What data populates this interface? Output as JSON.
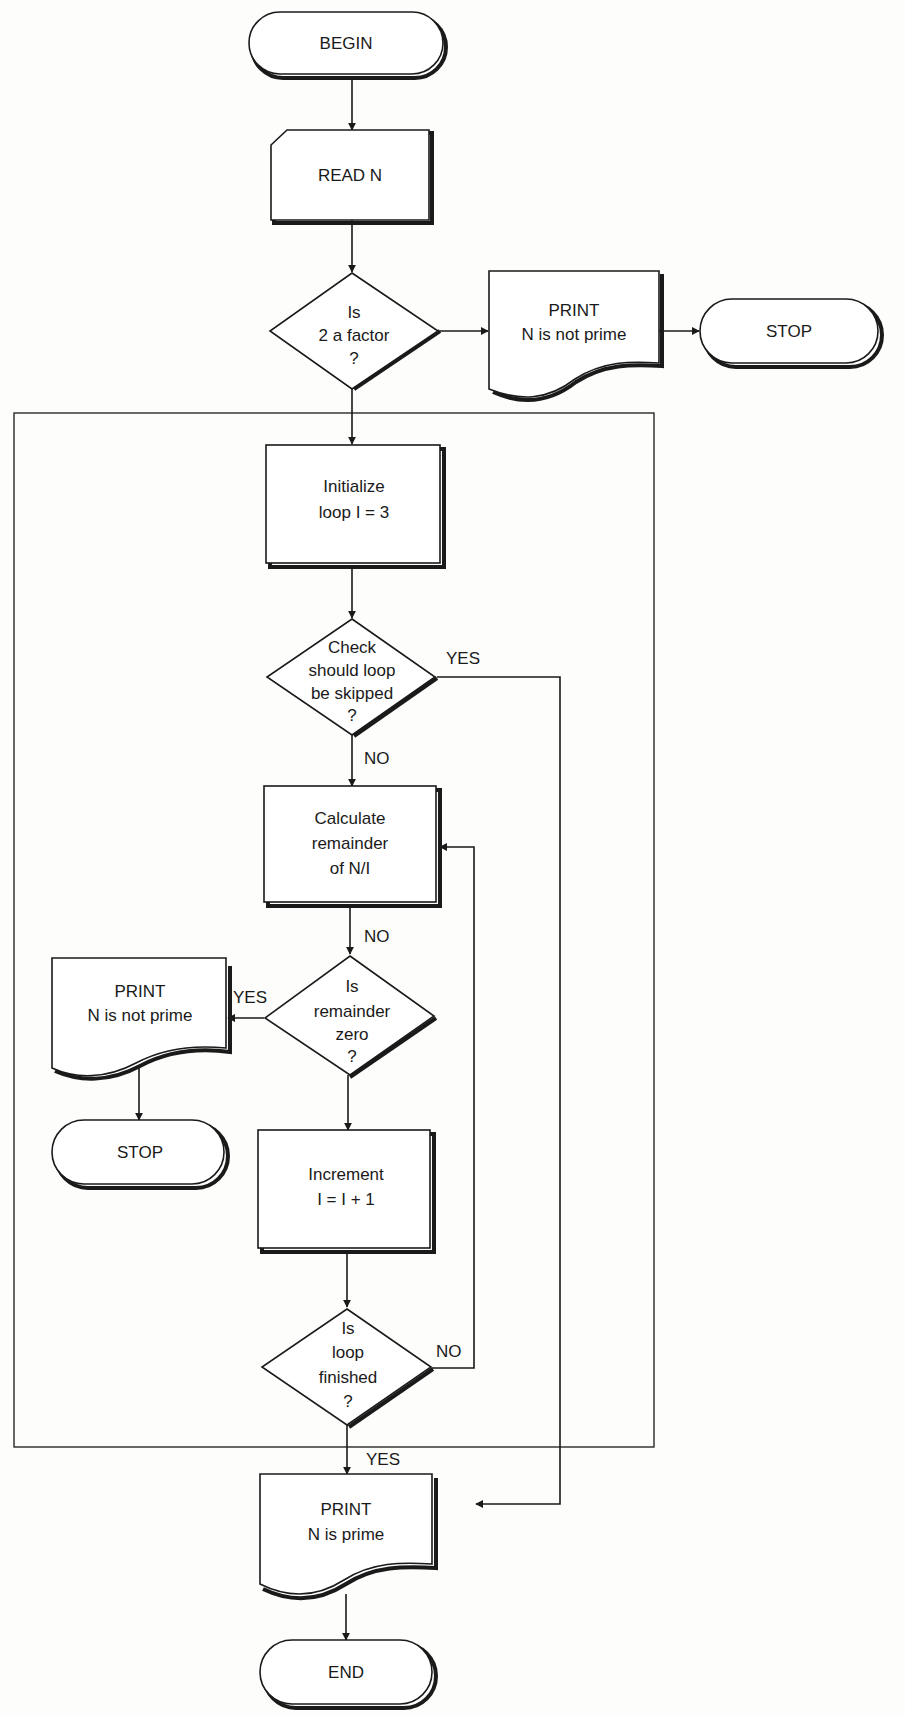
{
  "diagram": {
    "nodes": [
      {
        "id": "begin",
        "type": "terminal",
        "lines": [
          "BEGIN"
        ],
        "x": 248,
        "y": 12,
        "w": 196,
        "h": 64
      },
      {
        "id": "read",
        "type": "input",
        "lines": [
          "READ N"
        ],
        "x": 270,
        "y": 130,
        "w": 160,
        "h": 90
      },
      {
        "id": "two_factor",
        "type": "decision",
        "lines": [
          "Is",
          "2 a factor",
          "?"
        ],
        "cx": 356,
        "cy": 331,
        "hw": 84,
        "hh": 58
      },
      {
        "id": "print_not_prime_1",
        "type": "document",
        "lines": [
          "PRINT",
          "N is not prime"
        ],
        "x": 458,
        "y": 271,
        "w": 152,
        "h": 92
      },
      {
        "id": "stop_1",
        "type": "terminal",
        "lines": [
          "STOP"
        ],
        "x": 640,
        "y": 299,
        "w": 148,
        "h": 66
      },
      {
        "id": "init_loop",
        "type": "process",
        "lines": [
          "Initialize",
          "loop  I = 3"
        ],
        "x": 266,
        "y": 445,
        "w": 134,
        "h": 120
      },
      {
        "id": "skip_check",
        "type": "decision",
        "lines": [
          "Check",
          "should loop",
          "be skipped",
          "?"
        ],
        "cx": 352,
        "cy": 677,
        "hw": 85,
        "hh": 58
      },
      {
        "id": "calc_rem",
        "type": "process",
        "lines": [
          "Calculate",
          "remainder",
          "of N/I"
        ],
        "x": 264,
        "y": 786,
        "w": 174,
        "h": 118
      },
      {
        "id": "rem_zero",
        "type": "decision",
        "lines": [
          "Is",
          "remainder",
          "zero",
          "?"
        ],
        "cx": 348,
        "cy": 1015,
        "hw": 84,
        "hh": 60
      },
      {
        "id": "print_not_prime_2",
        "type": "document",
        "lines": [
          "PRINT",
          "N is not prime"
        ],
        "x": 52,
        "y": 958,
        "w": 174,
        "h": 92
      },
      {
        "id": "stop_2",
        "type": "terminal",
        "lines": [
          "STOP"
        ],
        "x": 52,
        "y": 1120,
        "w": 174,
        "h": 66
      },
      {
        "id": "increment",
        "type": "process",
        "lines": [
          "Increment",
          "I = I + 1"
        ],
        "x": 258,
        "y": 1130,
        "w": 174,
        "h": 120
      },
      {
        "id": "loop_done",
        "type": "decision",
        "lines": [
          "Is",
          "loop",
          "finished",
          "?"
        ],
        "cx": 347,
        "cy": 1365,
        "hw": 85,
        "hh": 58
      },
      {
        "id": "print_prime",
        "type": "document",
        "lines": [
          "PRINT",
          "N is prime"
        ],
        "x": 260,
        "y": 1474,
        "w": 174,
        "h": 100
      },
      {
        "id": "end",
        "type": "terminal",
        "lines": [
          "END"
        ],
        "x": 260,
        "y": 1640,
        "w": 174,
        "h": 66
      }
    ],
    "edges": [
      {
        "from": "begin",
        "to": "read",
        "label": ""
      },
      {
        "from": "read",
        "to": "two_factor",
        "label": ""
      },
      {
        "from": "two_factor",
        "to": "print_not_prime_1",
        "label": ""
      },
      {
        "from": "print_not_prime_1",
        "to": "stop_1",
        "label": ""
      },
      {
        "from": "two_factor",
        "to": "init_loop",
        "label": ""
      },
      {
        "from": "init_loop",
        "to": "skip_check",
        "label": ""
      },
      {
        "from": "skip_check",
        "to": "print_prime",
        "label": "YES"
      },
      {
        "from": "skip_check",
        "to": "calc_rem",
        "label": "NO"
      },
      {
        "from": "calc_rem",
        "to": "rem_zero",
        "label": "NO"
      },
      {
        "from": "rem_zero",
        "to": "print_not_prime_2",
        "label": "YES"
      },
      {
        "from": "print_not_prime_2",
        "to": "stop_2",
        "label": ""
      },
      {
        "from": "rem_zero",
        "to": "increment",
        "label": ""
      },
      {
        "from": "increment",
        "to": "loop_done",
        "label": ""
      },
      {
        "from": "loop_done",
        "to": "calc_rem",
        "label": "NO"
      },
      {
        "from": "loop_done",
        "to": "print_prime",
        "label": "YES"
      },
      {
        "from": "print_prime",
        "to": "end",
        "label": ""
      }
    ],
    "loop_frame": {
      "x": 14,
      "y": 413,
      "w": 640,
      "h": 1034
    },
    "labels": {
      "skip_yes": "YES",
      "skip_no": "NO",
      "calc_no": "NO",
      "rem_yes": "YES",
      "loop_no": "NO",
      "loop_yes": "YES"
    }
  }
}
